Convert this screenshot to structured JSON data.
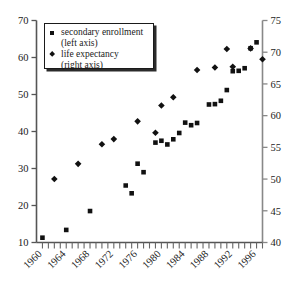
{
  "chart_data": {
    "type": "scatter",
    "title": "",
    "xlabel": "",
    "ylabel": "",
    "grid": false,
    "legend_position": "top-left",
    "xlim": [
      1959,
      1997
    ],
    "x_tick_labels": [
      "1960",
      "1964",
      "1968",
      "1972",
      "1976",
      "1980",
      "1984",
      "1988",
      "1992",
      "1996"
    ],
    "x_tick_values": [
      1960,
      1964,
      1968,
      1972,
      1976,
      1980,
      1984,
      1988,
      1992,
      1996
    ],
    "x_minor_tick_interval": 1,
    "left_axis": {
      "label": "secondary enrollment (left axis)",
      "ylim": [
        10,
        70
      ],
      "ticks": [
        10,
        20,
        30,
        40,
        50,
        60,
        70
      ]
    },
    "right_axis": {
      "label": "life expectancy (right axis)",
      "ylim": [
        40,
        75
      ],
      "ticks": [
        40,
        45,
        50,
        55,
        60,
        65,
        70,
        75
      ]
    },
    "series": [
      {
        "name": "secondary enrollment",
        "marker": "square",
        "axis": "left",
        "color": "#111111",
        "points": [
          {
            "x": 1960,
            "y": 11.3
          },
          {
            "x": 1964,
            "y": 13.4
          },
          {
            "x": 1968,
            "y": 18.5
          },
          {
            "x": 1974,
            "y": 25.4
          },
          {
            "x": 1975,
            "y": 23.3
          },
          {
            "x": 1976,
            "y": 31.3
          },
          {
            "x": 1977,
            "y": 29.0
          },
          {
            "x": 1979,
            "y": 37.0
          },
          {
            "x": 1980,
            "y": 37.5
          },
          {
            "x": 1981,
            "y": 36.5
          },
          {
            "x": 1982,
            "y": 37.9
          },
          {
            "x": 1983,
            "y": 39.6
          },
          {
            "x": 1984,
            "y": 42.4
          },
          {
            "x": 1985,
            "y": 41.7
          },
          {
            "x": 1986,
            "y": 42.3
          },
          {
            "x": 1988,
            "y": 47.3
          },
          {
            "x": 1989,
            "y": 47.4
          },
          {
            "x": 1990,
            "y": 48.3
          },
          {
            "x": 1991,
            "y": 51.2
          },
          {
            "x": 1992,
            "y": 56.3
          },
          {
            "x": 1993,
            "y": 56.4
          },
          {
            "x": 1994,
            "y": 57.1
          },
          {
            "x": 1995,
            "y": 62.5
          },
          {
            "x": 1996,
            "y": 64.1
          }
        ]
      },
      {
        "name": "life expectancy",
        "marker": "diamond",
        "axis": "right",
        "color": "#111111",
        "points": [
          {
            "x": 1962,
            "y": 50.0
          },
          {
            "x": 1966,
            "y": 52.4
          },
          {
            "x": 1970,
            "y": 55.5
          },
          {
            "x": 1972,
            "y": 56.3
          },
          {
            "x": 1976,
            "y": 59.1
          },
          {
            "x": 1979,
            "y": 57.3
          },
          {
            "x": 1980,
            "y": 61.6
          },
          {
            "x": 1982,
            "y": 62.9
          },
          {
            "x": 1986,
            "y": 67.2
          },
          {
            "x": 1989,
            "y": 67.6
          },
          {
            "x": 1991,
            "y": 70.5
          },
          {
            "x": 1992,
            "y": 67.7
          },
          {
            "x": 1995,
            "y": 70.6
          },
          {
            "x": 1997,
            "y": 68.9
          }
        ]
      }
    ]
  },
  "legend": {
    "items": [
      {
        "marker": "square",
        "line1": "secondary enrollment",
        "line2": "(left axis)"
      },
      {
        "marker": "diamond",
        "line1": "life expectancy",
        "line2": "(right axis)"
      }
    ]
  }
}
